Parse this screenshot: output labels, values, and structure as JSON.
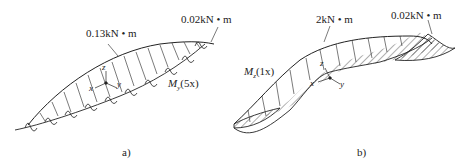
{
  "panels": [
    {
      "id": "a",
      "caption": "a)",
      "moment_label": "M",
      "moment_sub": "y",
      "moment_arg": "(5x)",
      "peak_value": "0.13kN • m",
      "end_value": "0.02kN • m",
      "axes": {
        "x": "x",
        "y": "y",
        "z": "z"
      }
    },
    {
      "id": "b",
      "caption": "b)",
      "moment_label": "M",
      "moment_sub": "z",
      "moment_arg": "(1x)",
      "peak_value": "2kN • m",
      "end_value": "0.02kN • m",
      "axes": {
        "x": "x",
        "y": "y",
        "z": "z"
      }
    }
  ],
  "colors": {
    "line": "#222222",
    "background": "#ffffff"
  }
}
